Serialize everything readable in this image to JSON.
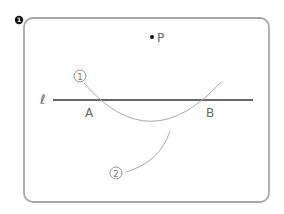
{
  "problem": {
    "number_marker": "❶"
  },
  "diagram": {
    "point_label": "P",
    "line_label": "ℓ",
    "intersection_a": "A",
    "intersection_b": "B",
    "arc1_label": "①",
    "arc2_label": "②"
  },
  "colors": {
    "frame": "#a8a8a8",
    "line": "#333333",
    "arc": "#aaaaaa",
    "text": "#666666",
    "point": "#111111"
  }
}
